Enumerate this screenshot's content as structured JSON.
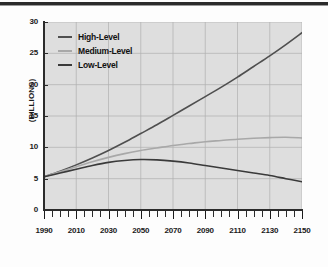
{
  "figure": {
    "rule_label": "top-divider"
  },
  "chart_data": {
    "type": "line",
    "title": "",
    "xlabel": "",
    "ylabel": "(BILLIONS)",
    "xlim": [
      1990,
      2150
    ],
    "ylim": [
      0,
      30
    ],
    "grid": true,
    "legend_position": "upper-left",
    "x_ticks": [
      "1990",
      "2010",
      "2030",
      "2050",
      "2070",
      "2090",
      "2110",
      "2130",
      "2150"
    ],
    "y_ticks": [
      "0",
      "5",
      "10",
      "15",
      "20",
      "25",
      "30"
    ],
    "x_minor_tick_step": 5,
    "x": [
      1990,
      2000,
      2010,
      2020,
      2030,
      2040,
      2050,
      2060,
      2070,
      2080,
      2090,
      2100,
      2110,
      2120,
      2130,
      2140,
      2150
    ],
    "series": [
      {
        "name": "High-Level",
        "color": "#4f4f4f",
        "values": [
          5.3,
          6.2,
          7.2,
          8.3,
          9.5,
          10.8,
          12.2,
          13.6,
          15.1,
          16.6,
          18.1,
          19.6,
          21.2,
          22.9,
          24.6,
          26.4,
          28.3
        ]
      },
      {
        "name": "Medium-Level",
        "color": "#a8a8a8",
        "values": [
          5.3,
          6.1,
          6.9,
          7.7,
          8.4,
          9.0,
          9.5,
          9.9,
          10.3,
          10.6,
          10.9,
          11.1,
          11.3,
          11.45,
          11.55,
          11.6,
          11.5
        ]
      },
      {
        "name": "Low-Level",
        "color": "#3a3a3a",
        "values": [
          5.3,
          5.9,
          6.5,
          7.1,
          7.6,
          7.9,
          8.05,
          8.0,
          7.8,
          7.5,
          7.1,
          6.7,
          6.3,
          5.9,
          5.5,
          5.0,
          4.5
        ]
      }
    ]
  },
  "colors": {
    "plot_background": "#dedede",
    "page_background": "#fdfdfd",
    "axis": "#2b2b2b",
    "gridline": "#b0b0b0"
  }
}
